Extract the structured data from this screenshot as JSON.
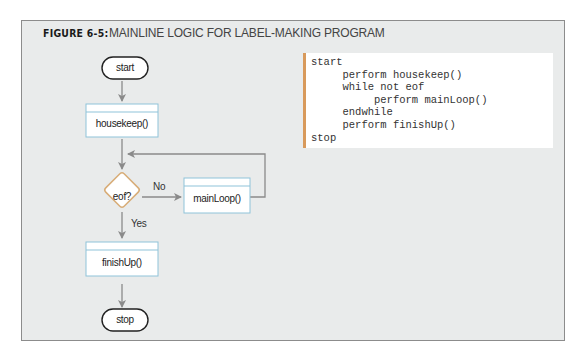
{
  "figure": {
    "label": "FIGURE 6-5:",
    "title": "MAINLINE LOGIC FOR LABEL-MAKING PROGRAM"
  },
  "flowchart": {
    "start_terminal": "start",
    "housekeep_box": "housekeep()",
    "decision": "eof?",
    "decision_no_label": "No",
    "decision_yes_label": "Yes",
    "mainloop_box": "mainLoop()",
    "finishup_box": "finishUp()",
    "stop_terminal": "stop"
  },
  "pseudocode": {
    "lines": [
      "start",
      "     perform housekeep()",
      "     while not eof",
      "          perform mainLoop()",
      "     endwhile",
      "     perform finishUp()",
      "stop"
    ]
  },
  "colors": {
    "panel_bg": "#e9ebeb",
    "box_border": "#8fc3d9",
    "decision_border": "#d8ad78",
    "code_accent": "#d89a5c",
    "connector": "#8a8a8a"
  }
}
